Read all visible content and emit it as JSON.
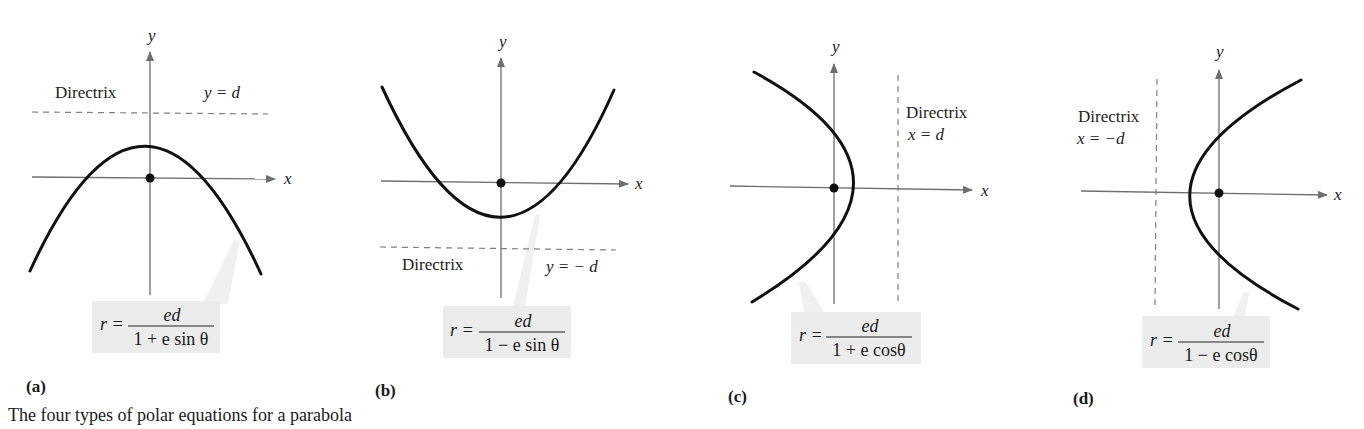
{
  "figure": {
    "caption": "The four types of polar equations for a parabola",
    "panels": [
      {
        "tag": "(a)",
        "orientation": "opens-down",
        "axis_x_label": "x",
        "axis_y_label": "y",
        "directrix_label": "Directrix",
        "directrix_equation": "y = d",
        "equation": {
          "lhs": "r =",
          "numerator": "ed",
          "denominator": "1 + e sin θ"
        }
      },
      {
        "tag": "(b)",
        "orientation": "opens-up",
        "axis_x_label": "x",
        "axis_y_label": "y",
        "directrix_label": "Directrix",
        "directrix_equation": "y = − d",
        "equation": {
          "lhs": "r =",
          "numerator": "ed",
          "denominator": "1 − e sin θ"
        }
      },
      {
        "tag": "(c)",
        "orientation": "opens-left",
        "axis_x_label": "x",
        "axis_y_label": "y",
        "directrix_label": "Directrix",
        "directrix_equation": "x = d",
        "equation": {
          "lhs": "r =",
          "numerator": "ed",
          "denominator": "1 + e cosθ"
        }
      },
      {
        "tag": "(d)",
        "orientation": "opens-right",
        "axis_x_label": "x",
        "axis_y_label": "y",
        "directrix_label": "Directrix",
        "directrix_equation": "x = −d",
        "equation": {
          "lhs": "r =",
          "numerator": "ed",
          "denominator": "1 − e cosθ"
        }
      }
    ],
    "colors": {
      "curve": "#111111",
      "axis": "#6e6e6e",
      "directrix": "#808080",
      "equation_box": "#ececec",
      "focus_point": "#111111"
    }
  }
}
